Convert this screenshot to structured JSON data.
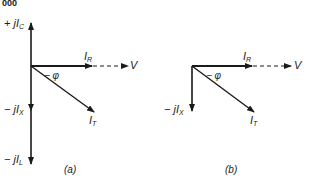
{
  "page_header": "000",
  "diagram_a": {
    "caption": "(a)",
    "labels": {
      "jic_prefix": "+ j",
      "jic_main": "I",
      "jic_sub": "C",
      "ir_main": "I",
      "ir_sub": "R",
      "v": "V",
      "phi": "− φ",
      "jix_prefix": "− j",
      "jix_main": "I",
      "jix_sub": "X",
      "it_main": "I",
      "it_sub": "T",
      "jil_prefix": "− j",
      "jil_main": "I",
      "jil_sub": "L"
    }
  },
  "diagram_b": {
    "caption": "(b)",
    "labels": {
      "ir_main": "I",
      "ir_sub": "R",
      "v": "V",
      "phi": "− φ",
      "jix_prefix": "− j",
      "jix_main": "I",
      "jix_sub": "X",
      "it_main": "I",
      "it_sub": "T"
    }
  },
  "colors": {
    "ink": "#1a1a1a",
    "background": "#ffffff"
  }
}
